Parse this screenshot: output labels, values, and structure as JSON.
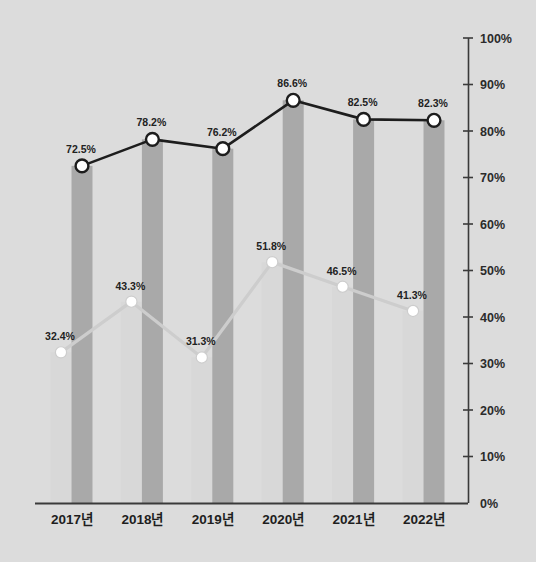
{
  "chart_data": {
    "type": "line",
    "title": "",
    "xlabel": "",
    "ylabel": "",
    "ylim": [
      0,
      100
    ],
    "grid": false,
    "legend_position": "none",
    "y_axis_position": "right",
    "categories": [
      "2017년",
      "2018년",
      "2019년",
      "2020년",
      "2021년",
      "2022년"
    ],
    "y_ticks": [
      "0%",
      "10%",
      "20%",
      "30%",
      "40%",
      "50%",
      "60%",
      "70%",
      "80%",
      "90%",
      "100%"
    ],
    "y_tick_values": [
      0,
      10,
      20,
      30,
      40,
      50,
      60,
      70,
      80,
      90,
      100
    ],
    "series": [
      {
        "name": "dark-series",
        "marker": "white-circle-dark-outline",
        "line_color": "#1d1d1d",
        "bar_color": "#a9a9a9",
        "values": [
          72.5,
          78.2,
          76.2,
          86.6,
          82.5,
          82.3
        ],
        "labels": [
          "72.5%",
          "78.2%",
          "76.2%",
          "86.6%",
          "82.5%",
          "82.3%"
        ]
      },
      {
        "name": "light-series",
        "marker": "white-circle",
        "line_color": "#cdcdcd",
        "bar_color": "#d8d8d8",
        "values": [
          32.4,
          43.3,
          31.3,
          51.8,
          46.5,
          41.3
        ],
        "labels": [
          "32.4%",
          "43.3%",
          "31.3%",
          "51.8%",
          "46.5%",
          "41.3%"
        ]
      }
    ],
    "colors": {
      "background": "#dcdcdc",
      "axis": "#3a3a3a",
      "dark_line": "#1d1d1d",
      "light_line": "#cdcdcd",
      "dark_bar": "#a9a9a9",
      "light_bar": "#d8d8d8",
      "marker_fill": "#ffffff",
      "label_text": "#222222"
    }
  }
}
